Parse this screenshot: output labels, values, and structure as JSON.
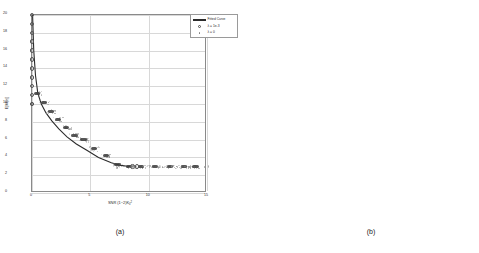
{
  "figure": {
    "captions": {
      "a": "(a)",
      "b": "(b)"
    }
  },
  "panel_a": {
    "xlabel_prefix": "SNR (1",
    "xlabel_mid": "2)K",
    "xlabel_sub": "0",
    "xlabel_sup": "2",
    "ylabel": "E[M(z)]",
    "legend": {
      "items": [
        {
          "symbol": "line",
          "label": "Fitted Curve"
        },
        {
          "symbol": "circle",
          "label": "λ = 1e-3"
        },
        {
          "symbol": "dot",
          "label": "λ = 0"
        }
      ]
    },
    "xticks": [
      "0",
      "5",
      "10",
      "15"
    ],
    "yticks": [
      "0",
      "2",
      "4",
      "6",
      "8",
      "10",
      "12",
      "14",
      "16",
      "18",
      "20"
    ],
    "xlim": [
      0,
      15
    ],
    "ylim": [
      0,
      20
    ]
  },
  "panel_b": {
    "xlabel": "ν₁",
    "ylabel": "ν₂",
    "xticks": [
      "3",
      "4",
      "5",
      "6",
      "7",
      "8",
      "9",
      "10",
      "11",
      "12",
      "13",
      "14",
      "15",
      "16",
      "17",
      "18",
      "19",
      "20"
    ],
    "yticks": [
      "3",
      "4",
      "5",
      "6",
      "7",
      "8",
      "9",
      "10",
      "11",
      "12",
      "13",
      "14",
      "15",
      "16",
      "17",
      "18",
      "19",
      "20"
    ],
    "colorbar_ticks": [
      "0",
      "0.1",
      "0.2",
      "0.3",
      "0.4",
      "0.5",
      "0.6",
      "0.7",
      "0.8",
      "0.9",
      "1"
    ]
  },
  "chart_data": [
    {
      "type": "scatter",
      "panel": "(a)",
      "title": "",
      "xlabel": "SNR (1-2)K_0^2",
      "ylabel": "E[M(z)]",
      "xlim": [
        0,
        15
      ],
      "ylim": [
        0,
        20
      ],
      "grid": true,
      "legend_position": "upper right",
      "series": [
        {
          "name": "Fitted Curve",
          "type": "line",
          "x": [
            0.05,
            0.15,
            0.3,
            0.5,
            0.8,
            1.2,
            1.7,
            2.3,
            3.0,
            3.8,
            4.7,
            5.7,
            6.8,
            7.6,
            8.2,
            8.7
          ],
          "y": [
            20.0,
            16.0,
            13.2,
            11.2,
            10.0,
            9.0,
            8.1,
            7.2,
            6.3,
            5.5,
            4.8,
            4.0,
            3.4,
            3.1,
            3.0,
            3.0
          ]
        },
        {
          "name": "λ = 1e-3",
          "type": "marker-open-circle",
          "x": [
            0.0,
            0.0,
            0.0,
            0.0,
            0.0,
            0.0,
            0.0,
            0.0,
            0.0,
            0.0,
            0.0,
            0.0,
            8.6,
            9.0
          ],
          "y": [
            20,
            19,
            18,
            17,
            16,
            15,
            14,
            13,
            12,
            11,
            10,
            10,
            3,
            3
          ]
        },
        {
          "name": "λ = 0",
          "type": "marker-dot-cloud",
          "x": [
            0.4,
            1.0,
            1.6,
            2.2,
            2.9,
            3.6,
            4.4,
            5.3,
            6.3,
            7.3,
            8.3,
            9.3,
            10.5,
            11.8,
            13.0,
            14.0
          ],
          "y": [
            11.2,
            10.2,
            9.2,
            8.3,
            7.4,
            6.5,
            6.0,
            5.0,
            4.2,
            3.2,
            3.0,
            3.0,
            3.0,
            3.0,
            3.0,
            3.0
          ]
        }
      ]
    },
    {
      "type": "heatmap",
      "panel": "(b)",
      "xlabel": "ν₁",
      "ylabel": "ν₂",
      "x": [
        3,
        4,
        5,
        6,
        7,
        8,
        9,
        10,
        11,
        12,
        13,
        14,
        15,
        16,
        17,
        18,
        19,
        20
      ],
      "y": [
        3,
        4,
        5,
        6,
        7,
        8,
        9,
        10,
        11,
        12,
        13,
        14,
        15,
        16,
        17,
        18,
        19,
        20
      ],
      "zlim": [
        0,
        1
      ],
      "colormap": "gray",
      "values": [
        [
          0.22,
          0.2,
          0.22,
          0.21,
          0.2,
          0.22,
          0.21,
          0.2,
          0.22,
          0.21,
          0.2,
          0.22,
          0.21,
          0.2,
          0.22,
          0.21,
          0.2,
          0.22
        ],
        [
          0.21,
          0.22,
          0.2,
          0.22,
          0.21,
          0.22,
          0.2,
          0.21,
          0.22,
          0.2,
          0.21,
          0.22,
          0.2,
          0.21,
          0.22,
          0.2,
          0.21,
          0.2
        ],
        [
          0.2,
          0.21,
          0.22,
          0.2,
          0.21,
          0.36,
          0.22,
          0.2,
          0.21,
          0.38,
          0.2,
          0.21,
          0.22,
          0.2,
          0.21,
          0.22,
          0.2,
          0.21
        ],
        [
          0.22,
          0.2,
          0.21,
          0.08,
          0.22,
          0.33,
          0.21,
          0.4,
          0.2,
          0.22,
          0.21,
          0.2,
          0.22,
          0.21,
          0.2,
          0.22,
          0.21,
          0.2
        ],
        [
          0.21,
          0.22,
          0.2,
          0.07,
          0.22,
          0.2,
          0.21,
          0.22,
          0.2,
          0.21,
          0.22,
          0.2,
          0.21,
          0.22,
          0.2,
          0.21,
          0.22,
          0.2
        ],
        [
          0.2,
          0.21,
          0.22,
          0.2,
          0.08,
          0.55,
          0.55,
          0.54,
          0.55,
          0.55,
          0.55,
          0.55,
          0.55,
          0.55,
          0.54,
          0.22,
          0.21,
          0.2
        ],
        [
          0.22,
          0.2,
          0.21,
          0.22,
          0.2,
          0.48,
          0.62,
          0.62,
          0.62,
          0.62,
          0.62,
          0.62,
          0.62,
          0.62,
          0.6,
          0.21,
          0.2,
          0.22
        ],
        [
          0.21,
          0.22,
          0.2,
          0.21,
          0.22,
          0.58,
          0.48,
          0.4,
          0.42,
          0.42,
          0.42,
          0.42,
          0.42,
          0.42,
          0.4,
          0.22,
          0.21,
          0.2
        ],
        [
          0.2,
          0.3,
          0.21,
          0.22,
          0.2,
          0.58,
          0.34,
          0.1,
          0.4,
          0.4,
          0.4,
          0.4,
          0.4,
          0.4,
          0.38,
          0.2,
          0.22,
          0.21
        ],
        [
          0.22,
          0.32,
          0.2,
          0.21,
          0.22,
          0.6,
          0.38,
          0.34,
          0.12,
          0.38,
          0.38,
          0.38,
          0.38,
          0.38,
          0.36,
          0.21,
          0.2,
          0.22
        ],
        [
          0.21,
          0.34,
          0.22,
          0.2,
          0.21,
          0.62,
          0.4,
          0.36,
          0.36,
          0.1,
          0.33,
          0.33,
          0.33,
          0.33,
          0.32,
          0.22,
          0.21,
          0.2
        ],
        [
          0.2,
          0.22,
          0.21,
          0.22,
          0.2,
          0.64,
          0.42,
          0.4,
          0.4,
          0.4,
          0.08,
          0.21,
          0.22,
          0.2,
          0.21,
          0.22,
          0.2,
          0.21
        ],
        [
          0.22,
          0.2,
          0.22,
          0.21,
          0.2,
          0.66,
          0.22,
          0.21,
          0.2,
          0.22,
          0.21,
          0.2,
          0.22,
          0.21,
          0.2,
          0.22,
          0.21,
          0.2
        ],
        [
          0.21,
          0.22,
          0.2,
          0.22,
          0.21,
          0.68,
          0.21,
          0.2,
          0.22,
          0.21,
          0.2,
          0.22,
          0.21,
          0.2,
          0.22,
          0.2,
          0.21,
          0.22
        ],
        [
          0.2,
          0.21,
          0.22,
          0.2,
          0.21,
          0.66,
          0.2,
          0.22,
          0.21,
          0.2,
          0.22,
          0.21,
          0.2,
          0.22,
          0.21,
          0.22,
          0.2,
          0.21
        ],
        [
          0.22,
          0.2,
          0.21,
          0.22,
          0.2,
          0.62,
          0.22,
          0.21,
          0.2,
          0.22,
          0.21,
          0.2,
          0.22,
          0.21,
          0.2,
          0.21,
          0.22,
          0.2
        ],
        [
          0.21,
          0.22,
          0.2,
          0.21,
          0.22,
          0.2,
          0.21,
          0.22,
          0.2,
          0.21,
          0.22,
          0.2,
          0.21,
          0.22,
          0.2,
          0.22,
          0.21,
          0.22
        ],
        [
          0.2,
          0.21,
          0.22,
          0.2,
          0.21,
          0.22,
          0.2,
          0.21,
          0.22,
          0.2,
          0.21,
          0.22,
          0.2,
          0.21,
          0.22,
          0.2,
          0.21,
          0.2
        ]
      ]
    }
  ]
}
